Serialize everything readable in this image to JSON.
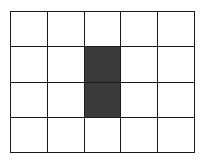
{
  "diagram": {
    "type": "grid",
    "columns": 5,
    "rows": 4,
    "line_color": "#1a1a1a",
    "empty_color": "#ffffff",
    "filled_color": "#3a3a3a",
    "filled_cells": [
      {
        "row": 2,
        "col": 3
      },
      {
        "row": 3,
        "col": 3
      }
    ]
  }
}
